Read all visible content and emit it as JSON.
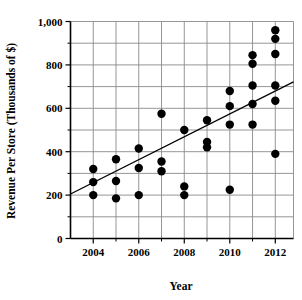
{
  "chart_data": {
    "type": "scatter",
    "title": "",
    "xlabel": "Year",
    "ylabel": "Revenue Per Store (Thousands of $)",
    "xlim": [
      2003.0,
      2012.8
    ],
    "ylim": [
      0,
      1000
    ],
    "grid": true,
    "legend": "none",
    "x_ticks": [
      {
        "value": 2004,
        "label": "2004"
      },
      {
        "value": 2005,
        "label": ""
      },
      {
        "value": 2006,
        "label": "2006"
      },
      {
        "value": 2007,
        "label": ""
      },
      {
        "value": 2008,
        "label": "2008"
      },
      {
        "value": 2009,
        "label": ""
      },
      {
        "value": 2010,
        "label": "2010"
      },
      {
        "value": 2011,
        "label": ""
      },
      {
        "value": 2012,
        "label": "2012"
      }
    ],
    "x_tick_labels": [
      "2004",
      "2006",
      "2008",
      "2010",
      "2012"
    ],
    "y_ticks": [
      {
        "value": 0,
        "label": "0"
      },
      {
        "value": 100,
        "label": ""
      },
      {
        "value": 200,
        "label": "200"
      },
      {
        "value": 300,
        "label": ""
      },
      {
        "value": 400,
        "label": "400"
      },
      {
        "value": 500,
        "label": ""
      },
      {
        "value": 600,
        "label": "600"
      },
      {
        "value": 700,
        "label": ""
      },
      {
        "value": 800,
        "label": "800"
      },
      {
        "value": 900,
        "label": ""
      },
      {
        "value": 1000,
        "label": "1,000"
      }
    ],
    "y_tick_labels": [
      "0",
      "200",
      "400",
      "600",
      "800",
      "1,000"
    ],
    "gridlines_x": [
      2004,
      2005,
      2006,
      2007,
      2008,
      2009,
      2010,
      2011,
      2012
    ],
    "gridlines_y": [
      100,
      200,
      300,
      400,
      500,
      600,
      700,
      800,
      900
    ],
    "marker": {
      "shape": "circle",
      "color": "#000000",
      "radius": 4.2
    },
    "points": [
      {
        "x": 2004,
        "y": 320
      },
      {
        "x": 2004,
        "y": 260
      },
      {
        "x": 2004,
        "y": 200
      },
      {
        "x": 2005,
        "y": 365
      },
      {
        "x": 2005,
        "y": 265
      },
      {
        "x": 2005,
        "y": 185
      },
      {
        "x": 2006,
        "y": 415
      },
      {
        "x": 2006,
        "y": 325
      },
      {
        "x": 2006,
        "y": 200
      },
      {
        "x": 2007,
        "y": 575
      },
      {
        "x": 2007,
        "y": 355
      },
      {
        "x": 2007,
        "y": 310
      },
      {
        "x": 2008,
        "y": 500
      },
      {
        "x": 2008,
        "y": 240
      },
      {
        "x": 2008,
        "y": 200
      },
      {
        "x": 2009,
        "y": 545
      },
      {
        "x": 2009,
        "y": 445
      },
      {
        "x": 2009,
        "y": 420
      },
      {
        "x": 2010,
        "y": 680
      },
      {
        "x": 2010,
        "y": 610
      },
      {
        "x": 2010,
        "y": 525
      },
      {
        "x": 2010,
        "y": 225
      },
      {
        "x": 2011,
        "y": 845
      },
      {
        "x": 2011,
        "y": 805
      },
      {
        "x": 2011,
        "y": 705
      },
      {
        "x": 2011,
        "y": 620
      },
      {
        "x": 2011,
        "y": 525
      },
      {
        "x": 2012,
        "y": 960
      },
      {
        "x": 2012,
        "y": 920
      },
      {
        "x": 2012,
        "y": 850
      },
      {
        "x": 2012,
        "y": 705
      },
      {
        "x": 2012,
        "y": 635
      },
      {
        "x": 2012,
        "y": 390
      }
    ],
    "trend_line": {
      "type": "linear-fit",
      "x_start": 2003.0,
      "y_start": 205,
      "x_end": 2012.8,
      "y_end": 722
    }
  }
}
